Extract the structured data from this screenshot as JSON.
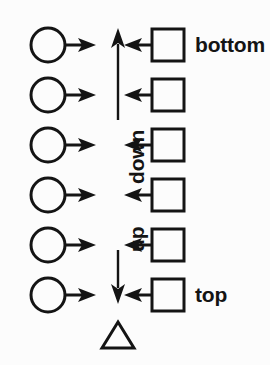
{
  "diagram": {
    "title": "",
    "background_color": "#fcfcfc",
    "stroke_color": "#141414",
    "axis": {
      "name": "vertical-double-arrow-axis",
      "x": 118,
      "top_y": 30,
      "bottom_y": 300,
      "top_arrow_direction": "up",
      "bottom_arrow_direction": "down",
      "labels": [
        {
          "text": "down",
          "orientation": "rotated-90-ccw",
          "x": 118,
          "y": 152
        },
        {
          "text": "up",
          "orientation": "rotated-90-ccw",
          "x": 118,
          "y": 228
        }
      ]
    },
    "end_labels": [
      {
        "text": "bottom",
        "x": 195,
        "y": 45,
        "anchor": "top-row"
      },
      {
        "text": "top",
        "x": 195,
        "y": 295,
        "anchor": "bottom-row"
      }
    ],
    "rows": [
      {
        "index": 0,
        "y": 45,
        "left_shape": "circle",
        "left_arrow": "right",
        "right_shape": "square",
        "right_arrow": "left",
        "label": "bottom"
      },
      {
        "index": 1,
        "y": 95,
        "left_shape": "circle",
        "left_arrow": "right",
        "right_shape": "square",
        "right_arrow": "left",
        "label": ""
      },
      {
        "index": 2,
        "y": 145,
        "left_shape": "circle",
        "left_arrow": "right",
        "right_shape": "square",
        "right_arrow": "left",
        "label": ""
      },
      {
        "index": 3,
        "y": 195,
        "left_shape": "circle",
        "left_arrow": "right",
        "right_shape": "square",
        "right_arrow": "left",
        "label": ""
      },
      {
        "index": 4,
        "y": 245,
        "left_shape": "circle",
        "left_arrow": "right",
        "right_shape": "square",
        "right_arrow": "left",
        "label": ""
      },
      {
        "index": 5,
        "y": 295,
        "left_shape": "circle",
        "left_arrow": "right",
        "right_shape": "square",
        "right_arrow": "left",
        "label": "top"
      }
    ],
    "marker": {
      "name": "triangle-marker",
      "shape": "triangle",
      "filled": false,
      "x": 118,
      "y": 336
    },
    "counts": {
      "circles": 6,
      "squares": 6,
      "rows": 6
    }
  }
}
